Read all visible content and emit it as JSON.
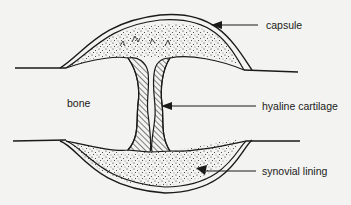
{
  "diagram": {
    "type": "anatomical-cross-section",
    "colors": {
      "background": "#f3f3f1",
      "ink": "#1a1a1a"
    },
    "labels": {
      "bone": "bone",
      "capsule": "capsule",
      "hyaline_cartilage": "hyaline cartilage",
      "synovial_lining": "synovial lining"
    }
  }
}
